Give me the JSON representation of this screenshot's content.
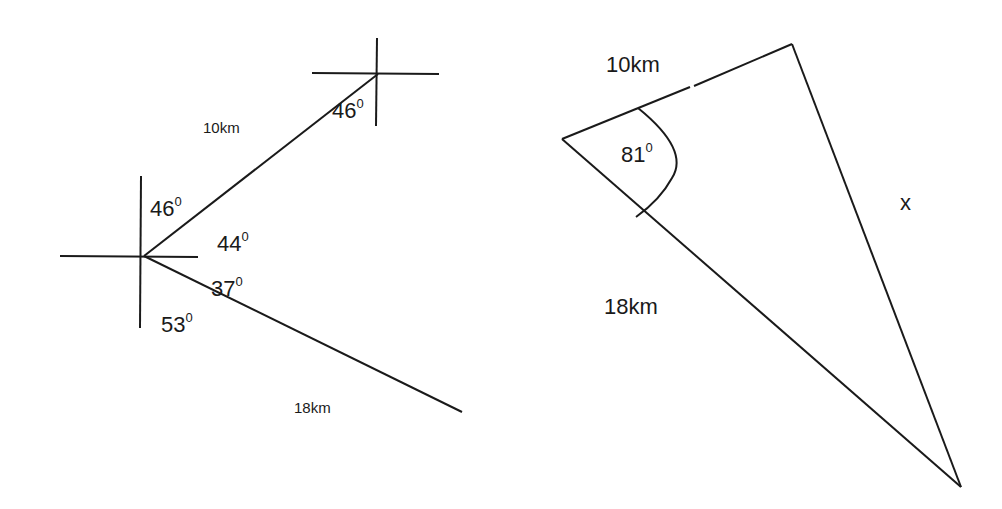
{
  "left_figure": {
    "bearing_top": "46",
    "bearing_point_label": "46",
    "angle_east_upper": "44",
    "angle_east_lower": "37",
    "angle_south": "53",
    "leg1_distance": "10km",
    "leg2_distance": "18km",
    "degree_mark": "0"
  },
  "right_figure": {
    "side_a": "10km",
    "side_b": "18km",
    "included_angle": "81",
    "unknown_side": "x",
    "degree_mark": "0"
  }
}
